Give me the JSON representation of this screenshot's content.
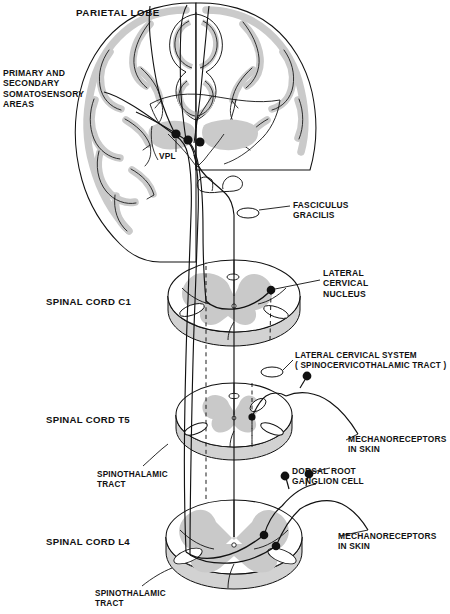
{
  "figure": {
    "colors": {
      "background": "#ffffff",
      "ink": "#111111",
      "gray_matter": "#c9c9c9",
      "cortical_ribbon": "#cfcfcf",
      "cut_surface": "#d4d4d4",
      "neuron_dot": "#111111"
    }
  },
  "labels": {
    "parietal_lobe": "PARIETAL LOBE",
    "primary_secondary": "PRIMARY AND\nSECONDARY\nSOMATOSENSORY\nAREAS",
    "vpl": "VPL",
    "fasciculus_gracilis": "FASCICULUS\nGRACILIS",
    "lateral_cervical_nucleus": "LATERAL\nCERVICAL\nNUCLEUS",
    "spinal_cord_c1": "SPINAL CORD C1",
    "lateral_cervical_system": "LATERAL CERVICAL SYSTEM\n( SPINOCERVICOTHALAMIC TRACT )",
    "spinal_cord_t5": "SPINAL CORD T5",
    "mechanoreceptors_t5": "MECHANORECEPTORS\nIN SKIN",
    "spinothalamic_tract_t5": "SPINOTHALAMIC\nTRACT",
    "dorsal_root_ganglion": "DORSAL ROOT\nGANGLION CELL",
    "spinal_cord_l4": "SPINAL CORD L4",
    "mechanoreceptors_l4": "MECHANORECEPTORS\nIN SKIN",
    "spinothalamic_tract_l4": "SPINOTHALAMIC\nTRACT"
  },
  "structures": {
    "brain_section": "coronal hemisection of cerebrum with thalamus",
    "brainstem": "medulla outline",
    "cord_levels": [
      "C1",
      "T5",
      "L4"
    ],
    "neuron_dots": {
      "vpl_relay_cells": 3,
      "lateral_cervical_nucleus_cells": 1,
      "dorsal_root_ganglion_cells_l4": 2,
      "dorsal_root_ganglion_cells_t5": 1
    },
    "fiber_markers": {
      "fasciculus_gracilis_ellipse": 1,
      "lateral_cervical_system_ellipse": 1
    }
  }
}
